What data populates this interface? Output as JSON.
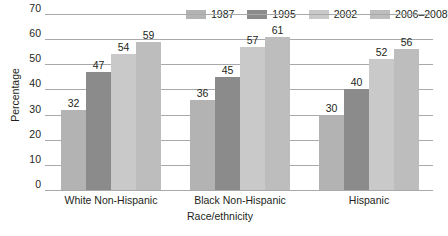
{
  "chart_data": {
    "type": "bar",
    "title": "",
    "xlabel": "Race/ethnicity",
    "ylabel": "Percentage",
    "categories": [
      "White Non-Hispanic",
      "Black Non-Hispanic",
      "Hispanic"
    ],
    "series": [
      {
        "name": "1987",
        "color": "#b3b3b3",
        "values": [
          32,
          36,
          30
        ]
      },
      {
        "name": "1995",
        "color": "#8b8b8b",
        "values": [
          47,
          45,
          40
        ]
      },
      {
        "name": "2002",
        "color": "#c9c9c9",
        "values": [
          54,
          57,
          52
        ]
      },
      {
        "name": "2006–2008",
        "color": "#bdbdbd",
        "values": [
          59,
          61,
          56
        ]
      }
    ],
    "ylim": [
      0,
      70
    ],
    "yticks": [
      0,
      10,
      20,
      30,
      40,
      50,
      60,
      70
    ],
    "ytick_labels": [
      "0",
      "10",
      "20",
      "30",
      "40",
      "50",
      "60",
      "70"
    ],
    "grid": true,
    "grid_color": "#a7a9ac",
    "legend_position": "top-right",
    "data_labels": true,
    "background": "#ffffff",
    "text_color": "#231f20"
  }
}
